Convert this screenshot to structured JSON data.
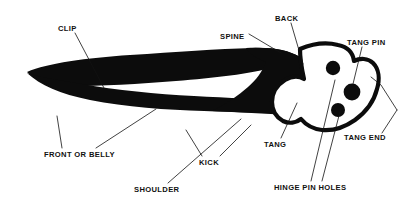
{
  "figure": {
    "background_color": "#ffffff",
    "ink_color": "#0c0c0c",
    "width": 410,
    "height": 205
  },
  "labels": [
    {
      "id": "clip",
      "text": "CLIP",
      "x": 58,
      "y": 31,
      "anchor": "start"
    },
    {
      "id": "spine",
      "text": "SPINE",
      "x": 220,
      "y": 39,
      "anchor": "start"
    },
    {
      "id": "back",
      "text": "BACK",
      "x": 275,
      "y": 21,
      "anchor": "start"
    },
    {
      "id": "tang_pin",
      "text": "TANG PIN",
      "x": 347,
      "y": 45,
      "anchor": "start"
    },
    {
      "id": "tang_end",
      "text": "TANG END",
      "x": 344,
      "y": 140,
      "anchor": "start"
    },
    {
      "id": "front_or_belly",
      "text": "FRONT OR BELLY",
      "x": 44,
      "y": 157,
      "anchor": "start"
    },
    {
      "id": "shoulder",
      "text": "SHOULDER",
      "x": 134,
      "y": 192,
      "anchor": "start"
    },
    {
      "id": "kick",
      "text": "KICK",
      "x": 199,
      "y": 165,
      "anchor": "start"
    },
    {
      "id": "tang",
      "text": "TANG",
      "x": 264,
      "y": 147,
      "anchor": "start"
    },
    {
      "id": "hinge_pin_holes",
      "text": "HINGE PIN HOLES",
      "x": 274,
      "y": 190,
      "anchor": "start"
    }
  ],
  "leaders": [
    {
      "id": "clip-leader",
      "points": "75,33 104,88"
    },
    {
      "id": "spine-leader",
      "points": "249,34 281,53"
    },
    {
      "id": "back-leader",
      "points": "291,23 303,64"
    },
    {
      "id": "tang-pin-leader",
      "points": "362,47 353,84"
    },
    {
      "id": "tang-end-leader",
      "points": "382,133 396,109"
    },
    {
      "id": "tang-end-bracket",
      "points": "396,109 380,84 370,77"
    },
    {
      "id": "front-belly-leader-a",
      "points": "62,148 58,116"
    },
    {
      "id": "front-belly-leader-b",
      "points": "96,148 156,109"
    },
    {
      "id": "shoulder-leader",
      "points": "168,183 240,120"
    },
    {
      "id": "kick-leader",
      "points": "202,156 188,130"
    },
    {
      "id": "kick-leader-b",
      "points": "219,156 249,126"
    },
    {
      "id": "tang-leader",
      "points": "281,138 296,104"
    },
    {
      "id": "hinge-leader-a",
      "points": "312,181 336,80"
    },
    {
      "id": "hinge-leader-b",
      "points": "322,181 341,108"
    }
  ],
  "shapes": {
    "clip_spine_body": "M27,72 C48,63 86,58 130,55 C176,52 218,49 252,48 C272,47 288,50 300,57 C306,61 309,66 310,71 C300,70 288,68 274,67 C250,74 214,78 176,81 C140,84 100,86 70,86 C52,86 36,81 27,72 Z",
    "belly_body": "M27,73 C40,85 60,94 90,100 C126,107 166,110 204,111 C238,112 268,113 290,114 C300,114 308,112 314,108 C306,105 296,102 288,100 C262,99 228,98 194,96 C156,94 116,90 82,84 C58,80 38,77 27,73 Z",
    "tang_solid": "M252,48 C272,47 288,50 300,57 C308,63 312,71 314,80 C316,92 316,103 314,110 C308,114 300,115 290,114 C268,113 240,112 214,111 C226,104 238,96 248,87 C256,80 262,72 268,63 C258,58 252,52 252,48 Z",
    "tang_outline": "M300,49 C312,44 326,42 338,45 C348,47 353,53 354,61 C360,58 368,58 373,63 C379,69 380,79 377,89 C374,101 366,112 355,120 C345,127 333,131 322,130 C313,129 306,125 301,119 C296,123 289,124 283,121 C276,117 272,110 272,102 C272,93 277,85 285,80 C292,76 299,76 304,79 C302,70 300,60 300,49 Z"
  },
  "holes": [
    {
      "id": "hinge-pin-hole-upper",
      "cx": 333,
      "cy": 68,
      "r": 7.2
    },
    {
      "id": "tang-pin",
      "cx": 352,
      "cy": 92,
      "r": 8.4
    },
    {
      "id": "hinge-pin-hole-lower",
      "cx": 338,
      "cy": 110,
      "r": 7.0
    }
  ]
}
